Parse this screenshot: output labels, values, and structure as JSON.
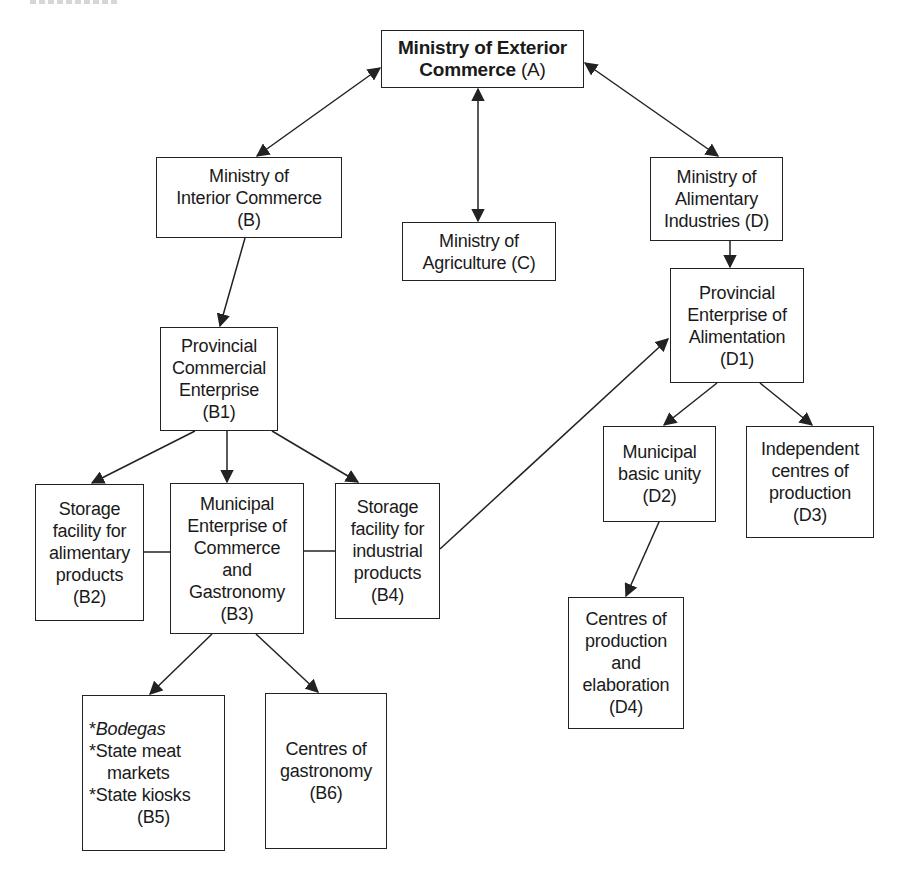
{
  "diagram": {
    "type": "organizational-flow",
    "nodes": {
      "A": {
        "lines": [
          "Ministry of Exterior",
          "Commerce"
        ],
        "code": "(A)",
        "bold": true
      },
      "B": {
        "lines": [
          "Ministry of",
          "Interior Commerce"
        ],
        "code": "(B)"
      },
      "C": {
        "lines": [
          "Ministry of",
          "Agriculture"
        ],
        "code": "(C)"
      },
      "D": {
        "lines": [
          "Ministry of",
          "Alimentary",
          "Industries"
        ],
        "code": "(D)"
      },
      "B1": {
        "lines": [
          "Provincial",
          "Commercial",
          "Enterprise"
        ],
        "code": "(B1)"
      },
      "B2": {
        "lines": [
          "Storage",
          "facility for",
          "alimentary",
          "products"
        ],
        "code": "(B2)"
      },
      "B3": {
        "lines": [
          "Municipal",
          "Enterprise of",
          "Commerce",
          "and",
          "Gastronomy"
        ],
        "code": "(B3)"
      },
      "B4": {
        "lines": [
          "Storage",
          "facility for",
          "industrial",
          "products"
        ],
        "code": "(B4)"
      },
      "B5": {
        "items": [
          "*",
          "Bodegas",
          "*State meat",
          "markets",
          "*State kiosks"
        ],
        "code": "(B5)"
      },
      "B6": {
        "lines": [
          "Centres of",
          "gastronomy"
        ],
        "code": "(B6)"
      },
      "D1": {
        "lines": [
          "Provincial",
          "Enterprise of",
          "Alimentation"
        ],
        "code": "(D1)"
      },
      "D2": {
        "lines": [
          "Municipal",
          "basic unity"
        ],
        "code": "(D2)"
      },
      "D3": {
        "lines": [
          "Independent",
          "centres of",
          "production"
        ],
        "code": "(D3)"
      },
      "D4": {
        "lines": [
          "Centres of",
          "production",
          "and",
          "elaboration"
        ],
        "code": "(D4)"
      }
    },
    "edges": [
      {
        "from": "A",
        "to": "B",
        "type": "bidirectional"
      },
      {
        "from": "A",
        "to": "C",
        "type": "bidirectional"
      },
      {
        "from": "A",
        "to": "D",
        "type": "bidirectional"
      },
      {
        "from": "B",
        "to": "B1",
        "type": "arrow"
      },
      {
        "from": "D",
        "to": "D1",
        "type": "arrow"
      },
      {
        "from": "B1",
        "to": "B2",
        "type": "arrow"
      },
      {
        "from": "B1",
        "to": "B3",
        "type": "arrow"
      },
      {
        "from": "B1",
        "to": "B4",
        "type": "arrow"
      },
      {
        "from": "B2",
        "to": "B3",
        "type": "line"
      },
      {
        "from": "B3",
        "to": "B4",
        "type": "line"
      },
      {
        "from": "B4",
        "to": "D1",
        "type": "arrow"
      },
      {
        "from": "B3",
        "to": "B5",
        "type": "arrow"
      },
      {
        "from": "B3",
        "to": "B6",
        "type": "arrow"
      },
      {
        "from": "D1",
        "to": "D2",
        "type": "arrow"
      },
      {
        "from": "D1",
        "to": "D3",
        "type": "arrow"
      },
      {
        "from": "D2",
        "to": "D4",
        "type": "arrow"
      }
    ],
    "colors": {
      "stroke": "#222222",
      "background": "#ffffff",
      "text": "#1a1a1a"
    }
  }
}
